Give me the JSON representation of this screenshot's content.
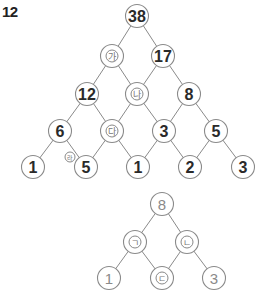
{
  "problem": {
    "number": "12"
  },
  "colors": {
    "stroke": "#8a8a8a",
    "number_text": "#2a2a2a",
    "label_text": "#777777",
    "light_number_text": "#8a8a8a"
  },
  "pyramid": {
    "rows": [
      [
        "38"
      ],
      [
        "가",
        "17"
      ],
      [
        "12",
        "나",
        "8"
      ],
      [
        "6",
        "다",
        "3",
        "5"
      ],
      [
        "1",
        "5",
        "1",
        "2",
        "3"
      ]
    ],
    "side_label": "라",
    "nodes": {
      "r0c0": "38",
      "r1c0": "가",
      "r1c1": "17",
      "r2c0": "12",
      "r2c1": "나",
      "r2c2": "8",
      "r3c0": "6",
      "r3c1": "다",
      "r3c2": "3",
      "r3c3": "5",
      "r4c0": "1",
      "r4c1": "5",
      "r4c2": "1",
      "r4c3": "2",
      "r4c4": "3"
    }
  },
  "sub_pyramid": {
    "rows": [
      [
        "8"
      ],
      [
        "ㄱ",
        "ㄴ"
      ],
      [
        "1",
        "ㄷ",
        "3"
      ]
    ],
    "nodes": {
      "top": "8",
      "mid_left": "ㄱ",
      "mid_right": "ㄴ",
      "bot_left": "1",
      "bot_mid": "ㄷ",
      "bot_right": "3"
    }
  }
}
